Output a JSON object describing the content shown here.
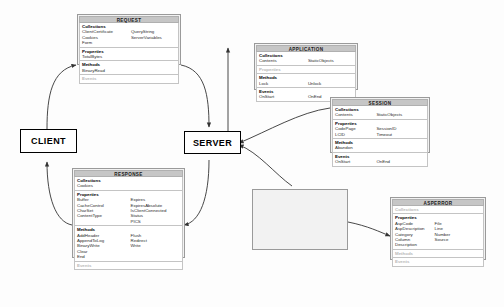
{
  "diagram": {
    "nodes": [
      {
        "id": "client",
        "label": "CLIENT"
      },
      {
        "id": "server",
        "label": "SERVER"
      }
    ],
    "section_labels": {
      "collections": "Collections",
      "properties": "Properties",
      "methods": "Methods",
      "events": "Events"
    },
    "objects": [
      {
        "id": "request",
        "title": "REQUEST",
        "sections": [
          {
            "name": "Collections",
            "empty": false,
            "rows": [
              [
                "ClientCertificate",
                "QueryString"
              ],
              [
                "Cookies",
                "ServerVariables"
              ],
              [
                "Form",
                ""
              ]
            ]
          },
          {
            "name": "Properties",
            "empty": false,
            "rows": [
              [
                "TotalBytes",
                ""
              ]
            ]
          },
          {
            "name": "Methods",
            "empty": false,
            "rows": [
              [
                "BinaryRead",
                ""
              ]
            ]
          },
          {
            "name": "Events",
            "empty": true,
            "rows": []
          }
        ]
      },
      {
        "id": "application",
        "title": "APPLICATION",
        "sections": [
          {
            "name": "Collections",
            "empty": false,
            "rows": [
              [
                "Contents",
                "StaticObjects"
              ]
            ]
          },
          {
            "name": "Properties",
            "empty": true,
            "rows": []
          },
          {
            "name": "Methods",
            "empty": false,
            "rows": [
              [
                "Lock",
                "Unlock"
              ]
            ]
          },
          {
            "name": "Events",
            "empty": false,
            "rows": [
              [
                "OnStart",
                "OnEnd"
              ]
            ]
          }
        ]
      },
      {
        "id": "session",
        "title": "SESSION",
        "sections": [
          {
            "name": "Collections",
            "empty": false,
            "rows": [
              [
                "Contents",
                "StaticObjects"
              ]
            ]
          },
          {
            "name": "Properties",
            "empty": false,
            "rows": [
              [
                "CodePage",
                "SessionID"
              ],
              [
                "LCID",
                "Timeout"
              ]
            ]
          },
          {
            "name": "Methods",
            "empty": false,
            "rows": [
              [
                "Abandon",
                ""
              ]
            ]
          },
          {
            "name": "Events",
            "empty": false,
            "rows": [
              [
                "OnStart",
                "OnEnd"
              ]
            ]
          }
        ]
      },
      {
        "id": "response",
        "title": "RESPONSE",
        "sections": [
          {
            "name": "Collections",
            "empty": false,
            "rows": [
              [
                "Cookies",
                ""
              ]
            ]
          },
          {
            "name": "Properties",
            "empty": false,
            "rows": [
              [
                "Buffer",
                "Expires"
              ],
              [
                "CacheControl",
                "ExpiresAbsolute"
              ],
              [
                "CharSet",
                "IsClientConnected"
              ],
              [
                "ContentType",
                "Status"
              ],
              [
                "",
                "PICS"
              ]
            ]
          },
          {
            "name": "Methods",
            "empty": false,
            "rows": [
              [
                "AddHeader",
                "Flush"
              ],
              [
                "AppendToLog",
                "Redirect"
              ],
              [
                "BinaryWrite",
                "Write"
              ],
              [
                "Clear",
                ""
              ],
              [
                "End",
                ""
              ]
            ]
          },
          {
            "name": "Events",
            "empty": true,
            "rows": []
          }
        ]
      },
      {
        "id": "serverobj",
        "title": "SERVER",
        "sections": [
          {
            "name": "Collections",
            "empty": true,
            "rows": []
          },
          {
            "name": "Properties",
            "empty": false,
            "rows": [
              [
                "ScriptTimeout",
                ""
              ]
            ]
          },
          {
            "name": "Methods",
            "empty": false,
            "rows": [
              [
                "CreateObject",
                "MapPath"
              ],
              [
                "Execute",
                "Transfer"
              ],
              [
                "GetLastError",
                "URLEncode"
              ],
              [
                "HTMLEncode",
                ""
              ]
            ]
          },
          {
            "name": "Events",
            "empty": true,
            "rows": []
          }
        ]
      },
      {
        "id": "asperror",
        "title": "ASPERROR",
        "sections": [
          {
            "name": "Collections",
            "empty": true,
            "rows": []
          },
          {
            "name": "Properties",
            "empty": false,
            "rows": [
              [
                "AspCode",
                "File"
              ],
              [
                "AspDescription",
                "Line"
              ],
              [
                "Category",
                "Number"
              ],
              [
                "Column",
                "Source"
              ],
              [
                "Description",
                ""
              ]
            ]
          },
          {
            "name": "Methods",
            "empty": true,
            "rows": []
          },
          {
            "name": "Events",
            "empty": true,
            "rows": []
          }
        ]
      }
    ],
    "colors": {
      "title_bar": "#c6c6c6",
      "box_fill": "#f2f2f2",
      "section_fill": "#ffffff",
      "border": "#9a9a9a",
      "arrow": "#333333",
      "disabled_text": "#b9b9b9"
    }
  }
}
